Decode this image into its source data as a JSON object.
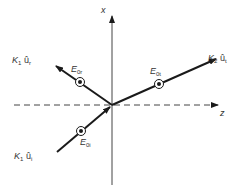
{
  "diagram": {
    "type": "wave-reflection-transmission-at-interface",
    "axes": {
      "vertical": {
        "label": "x"
      },
      "horizontal": {
        "label": "z",
        "style": "dashed"
      }
    },
    "rays": [
      {
        "id": "incident",
        "wave_vector_label": {
          "K": "K",
          "K_sub": "1",
          "unit": "û",
          "unit_sub": "i"
        },
        "field_label": {
          "E": "E",
          "sub": "0i"
        },
        "field_symbol": "out-of-page (circled dot)"
      },
      {
        "id": "reflected",
        "wave_vector_label": {
          "K": "K",
          "K_sub": "1",
          "unit": "û",
          "unit_sub": "r"
        },
        "field_label": {
          "E": "E",
          "sub": "0r"
        },
        "field_symbol": "out-of-page (circled dot)"
      },
      {
        "id": "transmitted",
        "wave_vector_label": {
          "K": "K",
          "K_sub": "2",
          "unit": "û",
          "unit_sub": "t"
        },
        "field_label": {
          "E": "E",
          "sub": "0t"
        },
        "field_symbol": "out-of-page (circled dot)"
      }
    ],
    "colors": {
      "line": "#1a1a1a",
      "axis": "#444444",
      "label": "#333333"
    }
  }
}
